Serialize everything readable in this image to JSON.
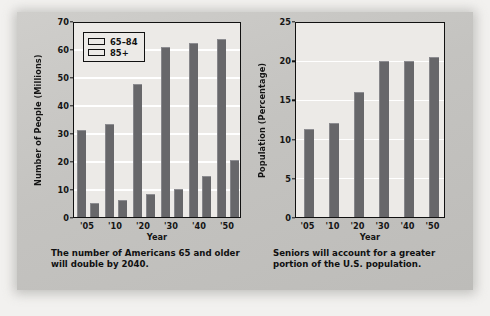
{
  "colors": {
    "panel_bg": "#c6c5c2",
    "plot_bg": "#eceae7",
    "bar": "#67676a",
    "gridline": "#ffffff",
    "axis": "#111111",
    "text": "#151515"
  },
  "chart_data": [
    {
      "id": "seniors-count",
      "type": "bar",
      "title": "",
      "xlabel": "Year",
      "ylabel": "Number of People (Millions)",
      "categories": [
        "'05",
        "'10",
        "'20",
        "'30",
        "'40",
        "'50"
      ],
      "yticks": [
        0,
        10,
        20,
        30,
        40,
        50,
        60,
        70
      ],
      "ylim": [
        0,
        70
      ],
      "grid": true,
      "legend_position": "top-left",
      "series": [
        {
          "name": "65–84",
          "values": [
            31.2,
            33.2,
            47.6,
            60.8,
            62.2,
            63.6
          ]
        },
        {
          "name": "85+",
          "values": [
            4.9,
            5.9,
            8.1,
            10.0,
            14.7,
            20.5
          ]
        }
      ],
      "caption": "The number of Americans 65 and older will double by 2040."
    },
    {
      "id": "seniors-percentage",
      "type": "bar",
      "title": "",
      "xlabel": "Year",
      "ylabel": "Population (Percentage)",
      "categories": [
        "'05",
        "'10",
        "'20",
        "'30",
        "'40",
        "'50"
      ],
      "yticks": [
        0,
        5,
        10,
        15,
        20,
        25
      ],
      "ylim": [
        0,
        25
      ],
      "grid": true,
      "legend_position": "none",
      "series": [
        {
          "name": "Population (Percentage)",
          "values": [
            11.2,
            12.0,
            16.0,
            19.9,
            19.9,
            20.4
          ]
        }
      ],
      "caption": "Seniors will account for a greater portion of the U.S. population."
    }
  ]
}
